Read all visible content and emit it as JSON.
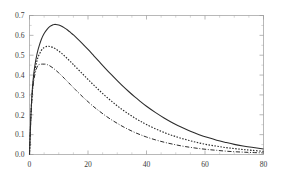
{
  "chart_data": {
    "type": "line",
    "title": "",
    "subtitle": "",
    "xlabel": "",
    "ylabel": "",
    "xlim": [
      0,
      80
    ],
    "ylim": [
      0,
      0.7
    ],
    "grid": false,
    "legend_position": "none",
    "x_ticks": [
      0,
      20,
      40,
      60,
      80
    ],
    "x_tick_labels": [
      "0",
      "20",
      "40",
      "60",
      "80"
    ],
    "y_ticks": [
      0.0,
      0.1,
      0.2,
      0.3,
      0.4,
      0.5,
      0.6,
      0.7
    ],
    "y_tick_labels": [
      "0.0",
      "0.1",
      "0.2",
      "0.3",
      "0.4",
      "0.5",
      "0.6",
      "0.7"
    ],
    "x_minor_ticks": [
      5,
      10,
      15,
      25,
      30,
      35,
      45,
      50,
      55,
      65,
      70,
      75
    ],
    "y_minor_ticks": [
      0.05,
      0.15,
      0.25,
      0.35,
      0.45,
      0.55,
      0.65
    ],
    "annotations": [],
    "series": [
      {
        "name": "curve-1",
        "style": "solid",
        "color": "#2b2b2b",
        "peak_x": 8.5,
        "peak_y": 0.655,
        "x": [
          0,
          0.5,
          1,
          1.5,
          2,
          2.5,
          3,
          4,
          5,
          6,
          7,
          8,
          8.5,
          9,
          10,
          11,
          12,
          13,
          14,
          15,
          16,
          18,
          20,
          22,
          24,
          26,
          28,
          30,
          32,
          34,
          36,
          38,
          40,
          43,
          46,
          49,
          52,
          55,
          58,
          61,
          64,
          67,
          70,
          73,
          76,
          80
        ],
        "y": [
          0.0,
          0.205,
          0.335,
          0.412,
          0.463,
          0.501,
          0.532,
          0.578,
          0.609,
          0.63,
          0.645,
          0.653,
          0.655,
          0.655,
          0.652,
          0.646,
          0.637,
          0.627,
          0.615,
          0.602,
          0.589,
          0.56,
          0.529,
          0.497,
          0.465,
          0.433,
          0.402,
          0.372,
          0.343,
          0.316,
          0.29,
          0.266,
          0.243,
          0.212,
          0.184,
          0.159,
          0.137,
          0.117,
          0.1,
          0.085,
          0.072,
          0.061,
          0.051,
          0.043,
          0.036,
          0.028
        ]
      },
      {
        "name": "curve-2",
        "style": "dotted",
        "color": "#2b2b2b",
        "peak_x": 6.5,
        "peak_y": 0.545,
        "x": [
          0,
          0.5,
          1,
          1.5,
          2,
          2.5,
          3,
          4,
          5,
          6,
          6.5,
          7,
          8,
          9,
          10,
          11,
          12,
          13,
          14,
          15,
          16,
          18,
          20,
          22,
          24,
          26,
          28,
          30,
          32,
          34,
          36,
          38,
          40,
          43,
          46,
          49,
          52,
          55,
          58,
          61,
          64,
          67,
          70,
          73,
          76,
          80
        ],
        "y": [
          0.0,
          0.2,
          0.322,
          0.392,
          0.437,
          0.469,
          0.493,
          0.523,
          0.539,
          0.545,
          0.545,
          0.544,
          0.539,
          0.531,
          0.521,
          0.509,
          0.496,
          0.482,
          0.468,
          0.453,
          0.438,
          0.408,
          0.378,
          0.349,
          0.321,
          0.294,
          0.269,
          0.245,
          0.223,
          0.203,
          0.184,
          0.167,
          0.151,
          0.13,
          0.111,
          0.095,
          0.081,
          0.069,
          0.058,
          0.049,
          0.042,
          0.035,
          0.03,
          0.025,
          0.021,
          0.016
        ]
      },
      {
        "name": "curve-3",
        "style": "dash-dot",
        "color": "#2b2b2b",
        "peak_x": 5.5,
        "peak_y": 0.455,
        "x": [
          0,
          0.5,
          1,
          1.5,
          2,
          2.5,
          3,
          4,
          5,
          5.5,
          6,
          7,
          8,
          9,
          10,
          11,
          12,
          13,
          14,
          15,
          16,
          18,
          20,
          22,
          24,
          26,
          28,
          30,
          32,
          34,
          36,
          38,
          40,
          43,
          46,
          49,
          52,
          55,
          58,
          61,
          64,
          67,
          70,
          73,
          76,
          80
        ],
        "y": [
          0.0,
          0.196,
          0.312,
          0.375,
          0.413,
          0.437,
          0.451,
          0.455,
          0.455,
          0.455,
          0.453,
          0.446,
          0.436,
          0.424,
          0.411,
          0.397,
          0.382,
          0.367,
          0.352,
          0.337,
          0.322,
          0.293,
          0.266,
          0.24,
          0.217,
          0.195,
          0.175,
          0.157,
          0.14,
          0.125,
          0.111,
          0.099,
          0.088,
          0.074,
          0.062,
          0.052,
          0.043,
          0.036,
          0.03,
          0.025,
          0.021,
          0.017,
          0.014,
          0.012,
          0.01,
          0.008
        ]
      }
    ]
  },
  "axis_colors": {
    "frame": "#9a9a9a",
    "tick_label": "#3a3a3a",
    "curve": "#2b2b2b",
    "background": "#ffffff"
  }
}
